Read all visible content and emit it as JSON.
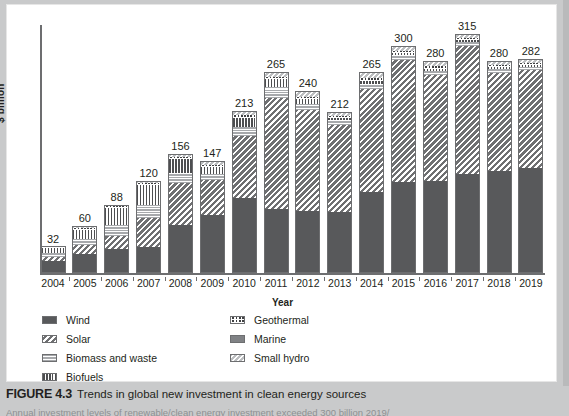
{
  "figure": {
    "number": "FIGURE 4.3",
    "caption": "Trends in global new investment in clean energy sources",
    "subcaption": "Annual investment levels of renewable/clean energy investment exceeded 300 billion 2019/"
  },
  "axes": {
    "ylabel": "$ billion",
    "xlabel": "Year"
  },
  "legend": {
    "left": [
      {
        "label": "Wind",
        "key": "wind",
        "pattern": "solid-dark",
        "color": "#58595b"
      },
      {
        "label": "Solar",
        "key": "solar",
        "pattern": "diagonal-hatch",
        "color": "#6f7072"
      },
      {
        "label": "Biomass and waste",
        "key": "biomass",
        "pattern": "horizontal-lines",
        "color": "#a7a9ac"
      },
      {
        "label": "Biofuels",
        "key": "biofuels",
        "pattern": "vertical-lines",
        "color": "#4d4e50"
      }
    ],
    "right": [
      {
        "label": "Geothermal",
        "key": "geothermal",
        "pattern": "checkered",
        "color": "#3f4042"
      },
      {
        "label": "Marine",
        "key": "marine",
        "pattern": "solid-mid",
        "color": "#808285"
      },
      {
        "label": "Small hydro",
        "key": "smallhydro",
        "pattern": "light-diagonal-hatch",
        "color": "#bcbec0"
      }
    ]
  },
  "chart_data": {
    "type": "bar",
    "stacked": true,
    "title": "Trends in global new investment in clean energy sources",
    "xlabel": "Year",
    "ylabel": "$ billion",
    "ylim": [
      0,
      330
    ],
    "grid": false,
    "legend_position": "below-plot",
    "categories": [
      "2004",
      "2005",
      "2006",
      "2007",
      "2008",
      "2009",
      "2010",
      "2011",
      "2012",
      "2013",
      "2014",
      "2015",
      "2016",
      "2017",
      "2018",
      "2019"
    ],
    "totals": [
      32,
      60,
      88,
      120,
      156,
      147,
      213,
      265,
      240,
      212,
      265,
      300,
      280,
      315,
      280,
      282
    ],
    "series": [
      {
        "name": "Wind",
        "values": [
          14,
          24,
          30,
          33,
          62,
          76,
          98,
          84,
          81,
          80,
          107,
          120,
          121,
          130,
          134,
          139
        ]
      },
      {
        "name": "Solar",
        "values": [
          5,
          12,
          17,
          38,
          56,
          47,
          82,
          148,
          135,
          116,
          137,
          162,
          141,
          170,
          131,
          131
        ]
      },
      {
        "name": "Biomass and waste",
        "values": [
          5,
          8,
          14,
          17,
          13,
          8,
          12,
          14,
          8,
          7,
          7,
          6,
          5,
          5,
          5,
          4
        ]
      },
      {
        "name": "Biofuels",
        "values": [
          6,
          12,
          22,
          26,
          18,
          9,
          12,
          10,
          7,
          3,
          4,
          3,
          2,
          2,
          2,
          2
        ]
      },
      {
        "name": "Geothermal",
        "values": [
          1,
          2,
          2,
          2,
          3,
          3,
          4,
          3,
          3,
          2,
          4,
          3,
          4,
          3,
          3,
          3
        ]
      },
      {
        "name": "Marine",
        "values": [
          0,
          0,
          0,
          0,
          0,
          0,
          0,
          0,
          0,
          0,
          0,
          0,
          0,
          0,
          0,
          0
        ]
      },
      {
        "name": "Small hydro",
        "values": [
          1,
          2,
          3,
          4,
          4,
          4,
          5,
          6,
          6,
          4,
          6,
          6,
          7,
          5,
          5,
          3
        ]
      }
    ]
  }
}
